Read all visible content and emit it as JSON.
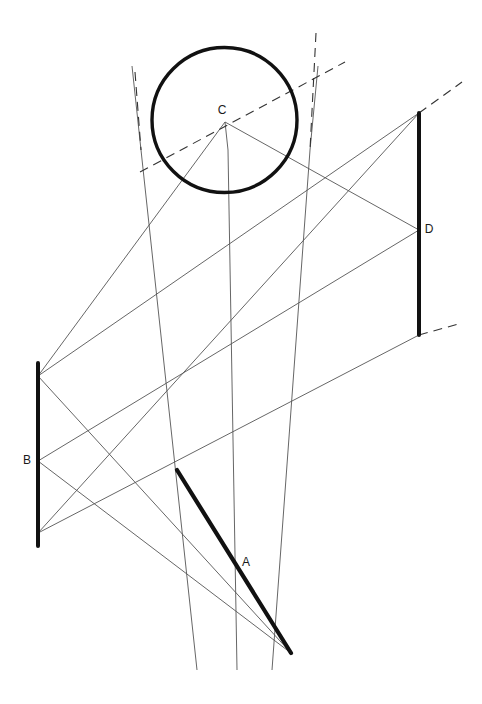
{
  "diagram": {
    "canvas": {
      "width": 482,
      "height": 704,
      "background": "#ffffff"
    },
    "colors": {
      "thick_stroke": "#111111",
      "thin_stroke": "#555555",
      "dashed_stroke": "#333333",
      "label_text": "#1a1a1a"
    },
    "labels": {
      "A": "A",
      "B": "B",
      "C": "C",
      "D": "D"
    },
    "label_positions": {
      "A": {
        "x": 246,
        "y": 563
      },
      "B": {
        "x": 27,
        "y": 461
      },
      "C": {
        "x": 222,
        "y": 111
      },
      "D": {
        "x": 429,
        "y": 230
      }
    },
    "circle": {
      "name": "object-circle-C",
      "cx": 224.5,
      "cy": 120,
      "r": 72.5,
      "stroke_width": 3.4
    },
    "thick_segments": [
      {
        "name": "segment-A",
        "label": "A",
        "x1": 177,
        "y1": 470,
        "x2": 291,
        "y2": 653,
        "stroke_width": 4.2
      },
      {
        "name": "segment-B",
        "label": "B",
        "x1": 38,
        "y1": 363,
        "x2": 38,
        "y2": 546,
        "stroke_width": 4.0
      },
      {
        "name": "segment-D",
        "label": "D",
        "x1": 419,
        "y1": 113,
        "x2": 419,
        "y2": 335,
        "stroke_width": 4.0
      }
    ],
    "projector_lines": [
      {
        "name": "projector-left",
        "x1": 141,
        "y1": 150,
        "x2": 197,
        "y2": 670
      },
      {
        "name": "projector-middle",
        "x1": 228,
        "y1": 150,
        "x2": 237,
        "y2": 670
      },
      {
        "name": "projector-right",
        "x1": 310,
        "y1": 150,
        "x2": 272,
        "y2": 670
      }
    ],
    "projector_upper": [
      {
        "name": "projector-left-upper",
        "x1": 132,
        "y1": 66,
        "x2": 141,
        "y2": 150
      },
      {
        "name": "projector-middle-upper",
        "x1": 225,
        "y1": 122,
        "x2": 228,
        "y2": 150
      },
      {
        "name": "projector-right-upper",
        "x1": 318,
        "y1": 66,
        "x2": 310,
        "y2": 150
      }
    ],
    "ray_lines": [
      {
        "name": "ray-Btop-to-Dtop",
        "x1": 38,
        "y1": 376,
        "x2": 419,
        "y2": 113
      },
      {
        "name": "ray-Bmid-to-Dmid",
        "x1": 38,
        "y1": 461,
        "x2": 419,
        "y2": 230
      },
      {
        "name": "ray-Bbot-to-Dbot",
        "x1": 38,
        "y1": 533,
        "x2": 419,
        "y2": 335
      },
      {
        "name": "ray-Btop-to-Abot",
        "x1": 38,
        "y1": 376,
        "x2": 291,
        "y2": 653
      },
      {
        "name": "ray-Bmid-to-Abot",
        "x1": 38,
        "y1": 461,
        "x2": 291,
        "y2": 653
      },
      {
        "name": "ray-C-to-Dmid",
        "x1": 225,
        "y1": 122,
        "x2": 419,
        "y2": 230
      },
      {
        "name": "ray-C-to-Btop",
        "x1": 225,
        "y1": 122,
        "x2": 38,
        "y2": 376
      },
      {
        "name": "ray-Dtop-to-lower-left",
        "x1": 419,
        "y1": 113,
        "x2": 38,
        "y2": 533
      }
    ],
    "dashed_lines": [
      {
        "name": "dashed-sightline-through-C",
        "x1": 140,
        "y1": 172,
        "x2": 345,
        "y2": 62
      },
      {
        "name": "dashed-projector-left-top",
        "x1": 135,
        "y1": 72,
        "x2": 141,
        "y2": 150
      },
      {
        "name": "dashed-projector-right-top",
        "x1": 316,
        "y1": 33,
        "x2": 310,
        "y2": 150
      },
      {
        "name": "dashed-extension-D-top",
        "x1": 419,
        "y1": 113,
        "x2": 462,
        "y2": 82
      },
      {
        "name": "dashed-extension-D-bottom",
        "x1": 419,
        "y1": 335,
        "x2": 462,
        "y2": 323
      }
    ]
  }
}
